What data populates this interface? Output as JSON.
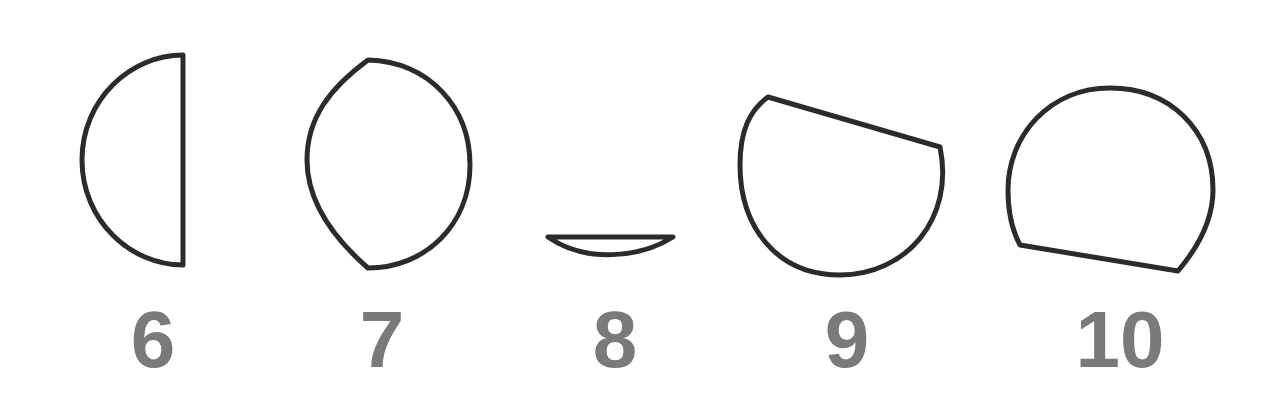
{
  "figure": {
    "shapes": [
      {
        "label": "6",
        "description": "half-circle with flat right edge"
      },
      {
        "label": "7",
        "description": "lens/teardrop shape"
      },
      {
        "label": "8",
        "description": "thin circular segment"
      },
      {
        "label": "9",
        "description": "circle with tilted chord cut on top"
      },
      {
        "label": "10",
        "description": "circle with tilted chord cut on bottom"
      }
    ],
    "stroke_color": "#2b2b2b",
    "label_color": "#7a7a7a"
  }
}
